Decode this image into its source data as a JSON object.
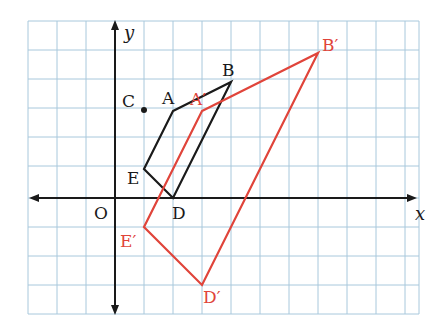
{
  "diagram": {
    "type": "coordinate-plane-transformation",
    "axes": {
      "x_label": "x",
      "y_label": "y",
      "origin_label": "O"
    },
    "grid": {
      "x_min": -3,
      "x_max": 10,
      "y_min": -4,
      "y_max": 6
    },
    "colors": {
      "original": "#1a1a1a",
      "image": "#e0443a",
      "grid": "#a8c8dc",
      "axis": "#1a1a1a"
    },
    "center_point": {
      "label": "C",
      "x": 1,
      "y": 3
    },
    "original_shape": {
      "points": [
        {
          "label": "A",
          "x": 2,
          "y": 3
        },
        {
          "label": "B",
          "x": 4,
          "y": 4
        },
        {
          "label": "D",
          "x": 2,
          "y": 0
        },
        {
          "label": "E",
          "x": 1,
          "y": 1
        }
      ]
    },
    "image_shape": {
      "points": [
        {
          "label": "A′",
          "x": 3,
          "y": 3
        },
        {
          "label": "B′",
          "x": 7,
          "y": 5
        },
        {
          "label": "D′",
          "x": 3,
          "y": -3
        },
        {
          "label": "E′",
          "x": 1,
          "y": -1
        }
      ]
    }
  },
  "labels": {
    "x": "x",
    "y": "y",
    "O": "O",
    "C": "C",
    "A": "A",
    "B": "B",
    "D": "D",
    "E": "E",
    "A_prime": "A′",
    "B_prime": "B′",
    "D_prime": "D′",
    "E_prime": "E′"
  }
}
